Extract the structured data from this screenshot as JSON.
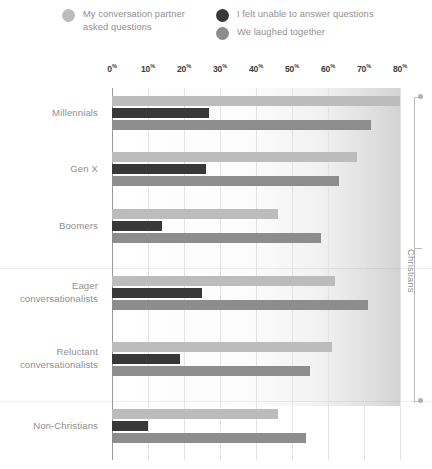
{
  "legend": {
    "items": [
      {
        "label": "My conversation partner\nasked questions",
        "color": "#bcbcbc",
        "icon": "legend-dot-icon"
      },
      {
        "label": "I felt unable to answer questions",
        "color": "#383838",
        "icon": "legend-dot-icon"
      },
      {
        "label": "We laughed together",
        "color": "#8d8d8d",
        "icon": "legend-dot-icon"
      }
    ]
  },
  "annotation": {
    "bracket_label": "Christians"
  },
  "chart_data": {
    "type": "bar",
    "orientation": "horizontal",
    "title": "",
    "xlabel": "",
    "ylabel": "",
    "xlim": [
      0,
      80
    ],
    "xticks": [
      0,
      10,
      20,
      30,
      40,
      50,
      60,
      70,
      80
    ],
    "xtick_labels": [
      "0%",
      "10%",
      "20%",
      "30%",
      "40%",
      "50%",
      "60%",
      "70%",
      "80%"
    ],
    "grid": true,
    "legend_position": "top",
    "categories": [
      "Millennials",
      "Gen X",
      "Boomers",
      "Eager\nconversationalists",
      "Reluctant\nconversationalists",
      "Non-Christians"
    ],
    "series": [
      {
        "name": "My conversation partner asked questions",
        "color": "#bcbcbc",
        "values": [
          80,
          68,
          46,
          62,
          61,
          46
        ]
      },
      {
        "name": "I felt unable to answer questions",
        "color": "#383838",
        "values": [
          27,
          26,
          14,
          25,
          19,
          10
        ]
      },
      {
        "name": "We laughed together",
        "color": "#8d8d8d",
        "values": [
          72,
          63,
          58,
          71,
          55,
          54
        ]
      }
    ],
    "group_annotation": {
      "label": "Christians",
      "covers": [
        "Millennials",
        "Gen X",
        "Boomers",
        "Eager conversationalists",
        "Reluctant conversationalists"
      ]
    }
  }
}
